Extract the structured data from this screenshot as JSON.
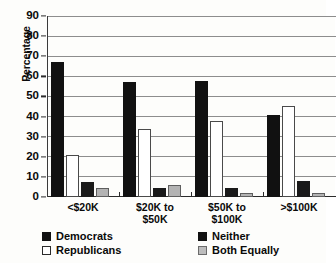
{
  "chart_data": {
    "type": "bar",
    "title": "",
    "subtitle": "",
    "xlabel": "",
    "ylabel": "Percentage",
    "ylim": [
      0,
      90
    ],
    "ytick_step": 10,
    "yticks": [
      0,
      10,
      20,
      30,
      40,
      50,
      60,
      70,
      80,
      90
    ],
    "ytick_labels": [
      "0",
      "10",
      "20",
      "30",
      "40",
      "50",
      "60",
      "70",
      "80",
      "90"
    ],
    "grid": true,
    "grid_axis": "y",
    "legend_position": "bottom",
    "categories": [
      "<$20K",
      "$20K to\n$50K",
      "$50K to\n$100K",
      ">$100K"
    ],
    "category_labels_flat": [
      "<$20K",
      "$20K to $50K",
      "$50K to $100K",
      ">$100K"
    ],
    "series": [
      {
        "name": "Democrats",
        "color": "#111111",
        "values": [
          67,
          57,
          57.5,
          41
        ]
      },
      {
        "name": "Republicans",
        "color": "#ffffff",
        "values": [
          21,
          34,
          38,
          45.5
        ]
      },
      {
        "name": "Neither",
        "color": "#1a1a1a",
        "values": [
          7.5,
          4.5,
          4.5,
          8
        ]
      },
      {
        "name": "Both Equally",
        "color": "#b3b3b3",
        "values": [
          4.5,
          6,
          2,
          2
        ]
      }
    ]
  },
  "legend": {
    "items": [
      {
        "label": "Democrats",
        "swatch": "black"
      },
      {
        "label": "Republicans",
        "swatch": "white"
      },
      {
        "label": "Neither",
        "swatch": "black"
      },
      {
        "label": "Both Equally",
        "swatch": "gray"
      }
    ]
  },
  "colors": {
    "democrats": "#111111",
    "republicans": "#ffffff",
    "neither": "#1a1a1a",
    "both_equally": "#b3b3b3",
    "gridline": "#8d8d8d",
    "axis": "#2b2b2b",
    "background": "#fdfdfb"
  }
}
